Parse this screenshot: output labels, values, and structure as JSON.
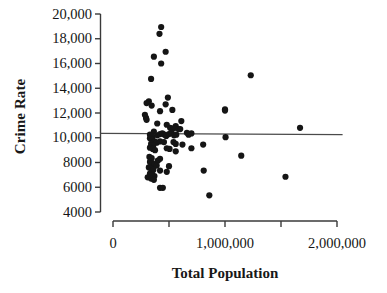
{
  "chart_data": {
    "type": "scatter",
    "title": "",
    "xlabel": "Total Population",
    "ylabel": "Crime Rate",
    "xlim": [
      0,
      2000000
    ],
    "ylim": [
      4000,
      20000
    ],
    "grid": false,
    "legend": null,
    "xticks": [
      {
        "value": 0,
        "label": "0"
      },
      {
        "value": 500000,
        "label": ""
      },
      {
        "value": 1000000,
        "label": "1,000,000"
      },
      {
        "value": 1500000,
        "label": ""
      },
      {
        "value": 2000000,
        "label": "2,000,000"
      }
    ],
    "yticks": [
      {
        "value": 20000,
        "label": "20,000"
      },
      {
        "value": 18000,
        "label": "18,000"
      },
      {
        "value": 16000,
        "label": "16,000"
      },
      {
        "value": 14000,
        "label": "14,000"
      },
      {
        "value": 12000,
        "label": "12,000"
      },
      {
        "value": 10000,
        "label": "10,000"
      },
      {
        "value": 8000,
        "label": "8000"
      },
      {
        "value": 6000,
        "label": "6000"
      },
      {
        "value": 4000,
        "label": "4000"
      }
    ],
    "marker_color": "#151515",
    "marker_size": 3.1,
    "trendline": {
      "name": "regression-line",
      "color": "#4a4a4a",
      "x_start": 0,
      "x_end": 2050000,
      "y_start": 10350,
      "y_end": 10260
    },
    "points": [
      [
        430000,
        18950
      ],
      [
        415000,
        18400
      ],
      [
        470000,
        16950
      ],
      [
        365000,
        16550
      ],
      [
        430000,
        16000
      ],
      [
        340000,
        14750
      ],
      [
        490000,
        13250
      ],
      [
        320000,
        12950
      ],
      [
        300000,
        12800
      ],
      [
        470000,
        12700
      ],
      [
        345000,
        12600
      ],
      [
        530000,
        12250
      ],
      [
        420000,
        12150
      ],
      [
        1000000,
        12300
      ],
      [
        1000000,
        12200
      ],
      [
        1230000,
        15050
      ],
      [
        285000,
        11850
      ],
      [
        295000,
        11600
      ],
      [
        300000,
        11450
      ],
      [
        395000,
        11150
      ],
      [
        610000,
        11350
      ],
      [
        560000,
        10950
      ],
      [
        480000,
        11050
      ],
      [
        1670000,
        10800
      ],
      [
        510000,
        10800
      ],
      [
        540000,
        10750
      ],
      [
        585000,
        10700
      ],
      [
        600000,
        10700
      ],
      [
        365000,
        10500
      ],
      [
        660000,
        10400
      ],
      [
        700000,
        10350
      ],
      [
        675000,
        10250
      ],
      [
        1005000,
        10050
      ],
      [
        330000,
        10250
      ],
      [
        350000,
        10100
      ],
      [
        395000,
        10200
      ],
      [
        420000,
        10300
      ],
      [
        440000,
        10350
      ],
      [
        460000,
        10250
      ],
      [
        475000,
        10150
      ],
      [
        500000,
        10300
      ],
      [
        520000,
        10400
      ],
      [
        545000,
        10200
      ],
      [
        565000,
        10250
      ],
      [
        330000,
        9950
      ],
      [
        350000,
        9850
      ],
      [
        370000,
        9700
      ],
      [
        390000,
        9600
      ],
      [
        340000,
        9500
      ],
      [
        360000,
        9400
      ],
      [
        420000,
        9700
      ],
      [
        455000,
        9650
      ],
      [
        540000,
        9650
      ],
      [
        560000,
        9500
      ],
      [
        620000,
        9450
      ],
      [
        700000,
        9150
      ],
      [
        805000,
        9450
      ],
      [
        330000,
        9200
      ],
      [
        355000,
        9100
      ],
      [
        375000,
        9000
      ],
      [
        480000,
        9150
      ],
      [
        505000,
        9100
      ],
      [
        560000,
        8900
      ],
      [
        1145000,
        8550
      ],
      [
        325000,
        8450
      ],
      [
        345000,
        8350
      ],
      [
        420000,
        8300
      ],
      [
        400000,
        8150
      ],
      [
        330000,
        8050
      ],
      [
        350000,
        7950
      ],
      [
        370000,
        7850
      ],
      [
        390000,
        7750
      ],
      [
        500000,
        7700
      ],
      [
        320000,
        7600
      ],
      [
        340000,
        7500
      ],
      [
        360000,
        7400
      ],
      [
        420000,
        7350
      ],
      [
        480000,
        7250
      ],
      [
        810000,
        7350
      ],
      [
        330000,
        7100
      ],
      [
        350000,
        7000
      ],
      [
        370000,
        6900
      ],
      [
        310000,
        6800
      ],
      [
        340000,
        6700
      ],
      [
        365000,
        6600
      ],
      [
        1540000,
        6850
      ],
      [
        420000,
        5950
      ],
      [
        445000,
        5950
      ],
      [
        860000,
        5350
      ]
    ]
  },
  "figure": {
    "background_color": "#ffffff",
    "axis_color": "#3a3a3a"
  }
}
